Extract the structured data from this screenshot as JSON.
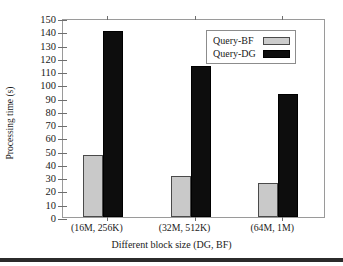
{
  "chart_data": {
    "type": "bar",
    "title": "",
    "xlabel": "Different block size (DG, BF)",
    "ylabel": "Processing time (s)",
    "categories": [
      "(16M, 256K)",
      "(32M, 512K)",
      "(64M, 1M)"
    ],
    "series": [
      {
        "name": "Query-BF",
        "values": [
          47,
          31,
          26
        ],
        "color": "#c9c9c9"
      },
      {
        "name": "Query-DG",
        "values": [
          140,
          114,
          93
        ],
        "color": "#0d0d0d"
      }
    ],
    "ylim": [
      0,
      150
    ],
    "ytick_values": [
      0,
      10,
      20,
      30,
      40,
      50,
      60,
      70,
      80,
      90,
      100,
      110,
      120,
      130,
      140,
      150
    ],
    "ytick_labels": [
      "0",
      "10",
      "20",
      "30",
      "40",
      "50",
      "60",
      "70",
      "80",
      "90",
      "100",
      "110",
      "120",
      "130",
      "140",
      "150"
    ],
    "grid": false,
    "legend_position": "upper right"
  },
  "legend": {
    "entries": [
      {
        "label": "Query-BF",
        "swatch": "bf"
      },
      {
        "label": "Query-DG",
        "swatch": "dg"
      }
    ]
  },
  "colors": {
    "bf_fill": "#c9c9c9",
    "dg_fill": "#0d0d0d",
    "axis": "#9a9a9a",
    "text": "#1a1a1a",
    "rule": "#2b2b2b"
  }
}
